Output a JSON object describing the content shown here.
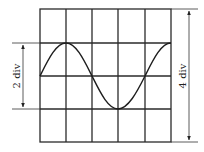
{
  "diagram": {
    "type": "oscilloscope-screen",
    "grid": {
      "columns": 5,
      "rows": 4,
      "line_color": "#2a2a2a"
    },
    "waveform": {
      "shape": "sine",
      "cycles": 1,
      "amplitude_divisions": 1,
      "peak_to_peak_divisions": 2,
      "color": "#1e1e1e"
    },
    "annotations": {
      "left_dimension": {
        "label": "2 div",
        "spans": "peak-to-peak of waveform"
      },
      "right_dimension": {
        "label": "4 div",
        "spans": "full screen height"
      }
    }
  }
}
